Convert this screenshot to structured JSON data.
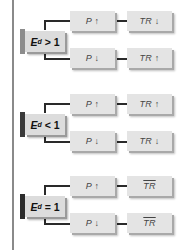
{
  "colors": {
    "box_fill": "#e4e4e4",
    "box_shadow": "#a9a9a9",
    "edge_light": "#8c8c8c",
    "edge_dark": "#3a3a3a",
    "edge_darker": "#2c2c2c",
    "connector": "#2a2a2a",
    "side_rule": "#8a8a8a"
  },
  "sections": [
    {
      "condition": {
        "symbol": "E",
        "subscript": "d",
        "operator": ">",
        "value": "1"
      },
      "branches": [
        {
          "price": "P ↑",
          "total_revenue": "TR ↓",
          "tr_overline": false
        },
        {
          "price": "P ↓",
          "total_revenue": "TR ↑",
          "tr_overline": false
        }
      ]
    },
    {
      "condition": {
        "symbol": "E",
        "subscript": "d",
        "operator": "<",
        "value": "1"
      },
      "branches": [
        {
          "price": "P ↑",
          "total_revenue": "TR ↑",
          "tr_overline": false
        },
        {
          "price": "P ↓",
          "total_revenue": "TR ↓",
          "tr_overline": false
        }
      ]
    },
    {
      "condition": {
        "symbol": "E",
        "subscript": "d",
        "operator": "=",
        "value": "1"
      },
      "branches": [
        {
          "price": "P ↑",
          "total_revenue": "TR",
          "tr_overline": true
        },
        {
          "price": "P ↓",
          "total_revenue": "TR",
          "tr_overline": true
        }
      ]
    }
  ]
}
